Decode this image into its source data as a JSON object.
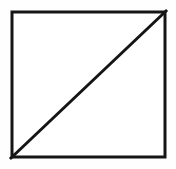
{
  "figure": {
    "title": "",
    "caption": "",
    "background_color": "#fefefe",
    "stroke_color": "#151515",
    "fill_color": "#ffffff",
    "canvas": {
      "width": 176,
      "height": 169
    }
  },
  "diagram_data": {
    "type": "geometric-figure",
    "description": "A square outlined in black containing one diagonal line drawn from the bottom-left corner to the top-right corner, splitting the square into two congruent right triangles.",
    "shapes": [
      {
        "name": "square",
        "kind": "rectangle",
        "x": 10.5,
        "y": 10.5,
        "width": 156,
        "height": 148,
        "stroke_width": 3,
        "stroke": "#151515",
        "fill": "#ffffff"
      },
      {
        "name": "diagonal",
        "kind": "line",
        "x1": 11,
        "y1": 158,
        "x2": 166,
        "y2": 11,
        "stroke_width": 3,
        "stroke": "#151515"
      }
    ],
    "vertices": [
      {
        "label": "top-left",
        "x": 10,
        "y": 10
      },
      {
        "label": "top-right",
        "x": 167,
        "y": 10
      },
      {
        "label": "bottom-right",
        "x": 167,
        "y": 159
      },
      {
        "label": "bottom-left",
        "x": 10,
        "y": 159
      }
    ],
    "regions": [
      {
        "name": "upper-left-triangle",
        "label": ""
      },
      {
        "name": "lower-right-triangle",
        "label": ""
      }
    ],
    "labels": [],
    "annotations": []
  }
}
